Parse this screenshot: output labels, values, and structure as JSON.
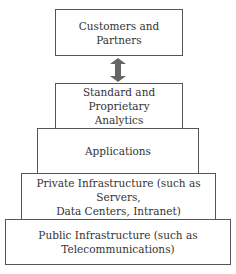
{
  "diagram": {
    "layers": [
      {
        "label": "Customers and Partners",
        "lines": [
          "Customers and",
          "Partners"
        ]
      },
      {
        "label": "Standard and Proprietary Analytics",
        "lines": [
          "Standard and Proprietary",
          "Analytics"
        ]
      },
      {
        "label": "Applications",
        "lines": [
          "Applications"
        ]
      },
      {
        "label": "Private Infrastructure (such as Servers, Data Centers, Intranet)",
        "lines": [
          "Private Infrastructure (such as Servers,",
          "Data Centers, Intranet)"
        ]
      },
      {
        "label": "Public Infrastructure (such as Telecommunications)",
        "lines": [
          "Public Infrastructure (such as",
          "Telecommunications)"
        ]
      }
    ],
    "connector": {
      "type": "double-arrow",
      "color": "#666666"
    }
  }
}
